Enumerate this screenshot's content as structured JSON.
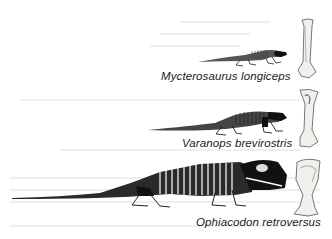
{
  "figure": {
    "type": "comparative-skeletal-reconstruction",
    "specimens": [
      {
        "name": "Mycterosaurus longiceps",
        "element": "skeleton",
        "bone_shown": "humerus",
        "relative_size": "small"
      },
      {
        "name": "Varanops brevirostris",
        "element": "skeleton",
        "bone_shown": "humerus",
        "relative_size": "medium"
      },
      {
        "name": "Ophiacodon retroversus",
        "element": "skeleton",
        "bone_shown": "humerus",
        "relative_size": "large"
      }
    ]
  },
  "colors": {
    "background": "#ffffff",
    "ink": "#111111",
    "label": "#1a1a1a",
    "bone_fill": "#f2f0ec",
    "bone_shade": "#b9b6b0"
  }
}
